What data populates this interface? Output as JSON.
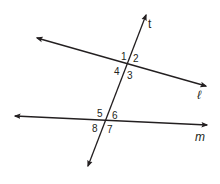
{
  "diagram": {
    "type": "parallel lines cut by a transversal",
    "colors": {
      "stroke": "#231f20",
      "background": "#ffffff"
    },
    "lines": [
      {
        "name": "t",
        "role": "transversal",
        "from": [
          88,
          166
        ],
        "to": [
          146,
          15
        ]
      },
      {
        "name": "ℓ",
        "role": "line",
        "from": [
          37,
          38
        ],
        "to": [
          206,
          86
        ]
      },
      {
        "name": "m",
        "role": "line",
        "from": [
          15,
          116
        ],
        "to": [
          207,
          125
        ]
      }
    ],
    "line_labels": {
      "t": "t",
      "l": "ℓ",
      "m": "m"
    },
    "angles": {
      "a1": "1",
      "a2": "2",
      "a3": "3",
      "a4": "4",
      "a5": "5",
      "a6": "6",
      "a7": "7",
      "a8": "8"
    }
  }
}
